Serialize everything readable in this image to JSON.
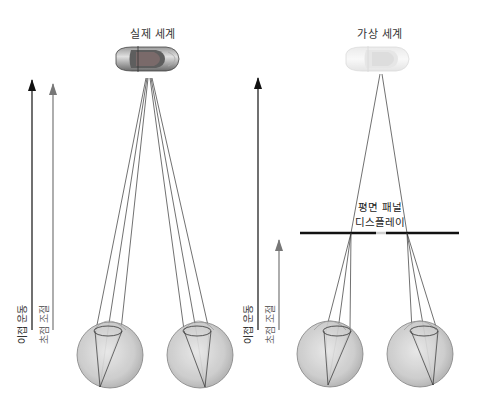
{
  "panels": {
    "real": {
      "title": "실제 세계",
      "vergence_label": "이접 운동",
      "accommodation_label": "초점 조절",
      "object": "car"
    },
    "virtual": {
      "title": "가상 세계",
      "vergence_label": "이접 운동",
      "accommodation_label": "초점 조절",
      "object": "car (virtual, faded)",
      "display_label_line1": "평면 패널",
      "display_label_line2": "디스플레이"
    }
  },
  "colors": {
    "vergence_arrow": "#111111",
    "accommodation_arrow": "#777777",
    "eye_fill": "#cfcfcf",
    "ray": "#333333"
  }
}
